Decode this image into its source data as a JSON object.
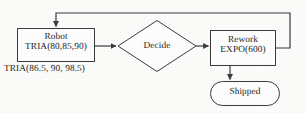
{
  "diagram": {
    "stroke_color": "#3c3c3c",
    "text_color": "#1a1a1a",
    "background_color": "#fdfdfc",
    "nodes": [
      {
        "id": "robot",
        "shape": "process-rectangle",
        "line1": "Robot",
        "line2": "TRIA(80,85,90)"
      },
      {
        "id": "decide",
        "shape": "decision-diamond",
        "line1": "Decide",
        "line2": ""
      },
      {
        "id": "rework",
        "shape": "process-rectangle",
        "line1": "Rework",
        "line2": "EXPO(600)"
      },
      {
        "id": "shipped",
        "shape": "terminator-rounded",
        "line1": "Shipped",
        "line2": ""
      }
    ],
    "annotations": [
      {
        "id": "robot-distribution-note",
        "text": "TRIA(86.5, 90, 98.5)"
      }
    ],
    "edges": [
      {
        "id": "robot-to-decide",
        "from": "robot",
        "to": "decide",
        "label": ""
      },
      {
        "id": "decide-to-rework",
        "from": "decide",
        "to": "rework",
        "label": ""
      },
      {
        "id": "rework-to-shipped",
        "from": "rework",
        "to": "shipped",
        "label": ""
      },
      {
        "id": "rework-feedback-to-robot",
        "from": "rework",
        "to": "robot",
        "label": ""
      }
    ]
  }
}
